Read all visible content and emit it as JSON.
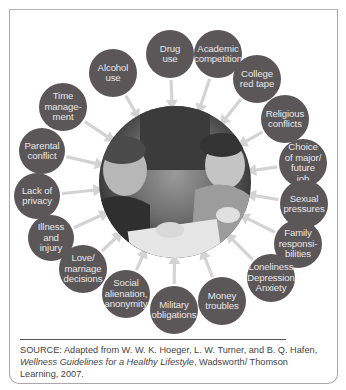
{
  "diagram": {
    "type": "radial-stressors",
    "center_image": "photo-two-students-studying",
    "colors": {
      "node_fill": "#5b5658",
      "node_text": "#e9e6e6",
      "arrow": "#d3d3d3",
      "frame": "#a8a8a8"
    },
    "nodes": [
      {
        "id": "drug",
        "label": "Drug\nuse",
        "cx": 170,
        "cy": 54,
        "r": 24
      },
      {
        "id": "academic",
        "label": "Academic\ncompetition",
        "cx": 218,
        "cy": 54,
        "r": 24
      },
      {
        "id": "college",
        "label": "College\nred tape",
        "cx": 257,
        "cy": 79,
        "r": 24
      },
      {
        "id": "religious",
        "label": "Religious\nconflicts",
        "cx": 285,
        "cy": 119,
        "r": 24
      },
      {
        "id": "choice",
        "label": "Choice\nof major/\nfuture\njob",
        "cx": 303,
        "cy": 163,
        "r": 24
      },
      {
        "id": "sexual",
        "label": "Sexual\npressures",
        "cx": 304,
        "cy": 204,
        "r": 24
      },
      {
        "id": "family",
        "label": "Family\nresponsi-\nbilities",
        "cx": 298,
        "cy": 244,
        "r": 24
      },
      {
        "id": "loneliness",
        "label": "Loneliness\nDepression\nAnxiety",
        "cx": 271,
        "cy": 278,
        "r": 24
      },
      {
        "id": "money",
        "label": "Money\ntroubles",
        "cx": 222,
        "cy": 301,
        "r": 24
      },
      {
        "id": "military",
        "label": "Military\nobligations",
        "cx": 174,
        "cy": 310,
        "r": 24
      },
      {
        "id": "social",
        "label": "Social\nalienation,\nanonymity",
        "cx": 126,
        "cy": 294,
        "r": 24
      },
      {
        "id": "love",
        "label": "Love/\nmarriage\ndecisions",
        "cx": 83,
        "cy": 269,
        "r": 24
      },
      {
        "id": "illness",
        "label": "Illness\nand\ninjury",
        "cx": 51,
        "cy": 238,
        "r": 23
      },
      {
        "id": "privacy",
        "label": "Lack of\nprivacy",
        "cx": 37,
        "cy": 196,
        "r": 23
      },
      {
        "id": "parental",
        "label": "Parental\nconflict",
        "cx": 42,
        "cy": 151,
        "r": 23
      },
      {
        "id": "time",
        "label": "Time\nmanage-\nment",
        "cx": 63,
        "cy": 107,
        "r": 24
      },
      {
        "id": "alcohol",
        "label": "Alcohol\nuse",
        "cx": 113,
        "cy": 73,
        "r": 24
      }
    ],
    "center": {
      "cx": 175,
      "cy": 182,
      "r": 78
    }
  },
  "source": {
    "prefix": "SOURCE: Adapted from W. W. K. Hoeger, L. W. Turner, and B. Q. Hafen, ",
    "title": "Wellness Guidelines for a Healthy Lifestyle",
    "suffix": ", Wadsworth/ Thomson Learning, 2007."
  }
}
